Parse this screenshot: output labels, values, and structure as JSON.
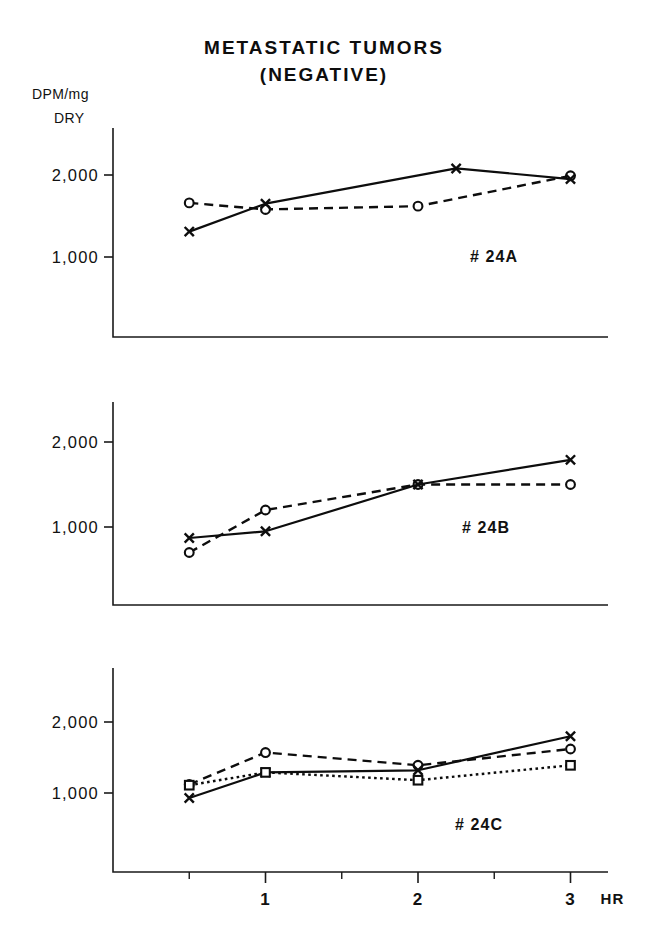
{
  "figure": {
    "title_lines": [
      "METASTATIC TUMORS",
      "(NEGATIVE)"
    ],
    "y_axis_caption_line1": "DPM/mg",
    "y_axis_caption_line2": "DRY",
    "x_unit_label": "HR"
  },
  "chart_data": [
    {
      "type": "line",
      "panel_label": "# 24A",
      "title": "METASTATIC TUMORS (NEGATIVE)",
      "xlabel": "HR",
      "ylabel": "DPM/mg DRY",
      "xlim": [
        0,
        3.5
      ],
      "ylim": [
        0,
        2550
      ],
      "ytick_values": [
        1000,
        2000
      ],
      "ytick_labels": [
        "1,000",
        "2,000"
      ],
      "xtick_values": [
        1,
        2,
        3
      ],
      "xtick_labels": [
        "1",
        "2",
        "3"
      ],
      "xtick_minor_values": [
        0.5,
        1.5,
        2.5
      ],
      "grid": false,
      "legend": "none",
      "series": [
        {
          "name": "open-circle-dashed",
          "marker": "circle",
          "line_style": "dashed",
          "x": [
            0.5,
            1.0,
            2.0,
            3.0
          ],
          "values": [
            1660,
            1580,
            1620,
            1990
          ]
        },
        {
          "name": "x-solid",
          "marker": "x",
          "line_style": "solid",
          "x": [
            0.5,
            1.0,
            2.25,
            3.0
          ],
          "values": [
            1310,
            1650,
            2080,
            1950
          ]
        }
      ]
    },
    {
      "type": "line",
      "panel_label": "# 24B",
      "xlabel": "HR",
      "ylabel": "DPM/mg DRY",
      "xlim": [
        0,
        3.5
      ],
      "ylim": [
        0,
        2550
      ],
      "ytick_values": [
        1000,
        2000
      ],
      "ytick_labels": [
        "1,000",
        "2,000"
      ],
      "xtick_values": [
        1,
        2,
        3
      ],
      "xtick_labels": [
        "1",
        "2",
        "3"
      ],
      "xtick_minor_values": [
        0.5,
        1.5,
        2.5
      ],
      "grid": false,
      "legend": "none",
      "series": [
        {
          "name": "open-circle-dashed",
          "marker": "circle",
          "line_style": "dashed",
          "x": [
            0.5,
            1.0,
            2.0,
            3.0
          ],
          "values": [
            700,
            1200,
            1500,
            1500
          ]
        },
        {
          "name": "x-solid",
          "marker": "x",
          "line_style": "solid",
          "x": [
            0.5,
            1.0,
            2.0,
            3.0
          ],
          "values": [
            870,
            950,
            1500,
            1790
          ]
        }
      ]
    },
    {
      "type": "line",
      "panel_label": "# 24C",
      "xlabel": "HR",
      "ylabel": "DPM/mg DRY",
      "xlim": [
        0,
        3.5
      ],
      "ylim": [
        0,
        2550
      ],
      "ytick_values": [
        1000,
        2000
      ],
      "ytick_labels": [
        "1,000",
        "2,000"
      ],
      "xtick_values": [
        1,
        2,
        3
      ],
      "xtick_labels": [
        "1",
        "2",
        "3"
      ],
      "xtick_minor_values": [
        0.5,
        1.5,
        2.5
      ],
      "grid": false,
      "legend": "none",
      "series": [
        {
          "name": "open-circle-dashed",
          "marker": "circle",
          "line_style": "dashed",
          "x": [
            0.5,
            1.0,
            2.0,
            3.0
          ],
          "values": [
            1120,
            1570,
            1390,
            1620
          ]
        },
        {
          "name": "x-solid",
          "marker": "x",
          "line_style": "solid",
          "x": [
            0.5,
            1.0,
            2.0,
            3.0
          ],
          "values": [
            930,
            1290,
            1320,
            1800
          ]
        },
        {
          "name": "open-square-dotted",
          "marker": "square",
          "line_style": "dotted",
          "x": [
            0.5,
            1.0,
            2.0,
            3.0
          ],
          "values": [
            1110,
            1290,
            1180,
            1390
          ]
        }
      ]
    }
  ]
}
